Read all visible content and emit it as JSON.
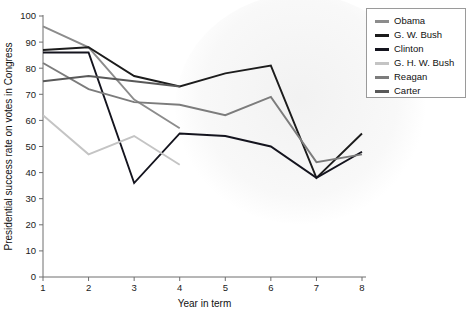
{
  "chart_data": {
    "type": "line",
    "title": "",
    "xlabel": "Year in term",
    "ylabel": "Presidential success rate on votes in Congress",
    "x": [
      1,
      2,
      3,
      4,
      5,
      6,
      7,
      8
    ],
    "xlim": [
      1,
      8
    ],
    "ylim": [
      0,
      100
    ],
    "xticks": [
      "1",
      "2",
      "3",
      "4",
      "5",
      "6",
      "7",
      "8"
    ],
    "yticks": [
      "0",
      "10",
      "20",
      "30",
      "40",
      "50",
      "60",
      "70",
      "80",
      "90",
      "100"
    ],
    "grid": false,
    "legend_position": "top-right",
    "series": [
      {
        "name": "Obama",
        "color": "#8c8c8c",
        "x": [
          1,
          2,
          3,
          4
        ],
        "values": [
          96,
          88,
          68,
          57
        ]
      },
      {
        "name": "G. W. Bush",
        "color": "#1c1c1c",
        "x": [
          1,
          2,
          3,
          4,
          5,
          6,
          7,
          8
        ],
        "values": [
          87,
          88,
          77,
          73,
          78,
          81,
          38,
          55
        ]
      },
      {
        "name": "Clinton",
        "color": "#14141e",
        "x": [
          1,
          2,
          3,
          4,
          5,
          6,
          7,
          8
        ],
        "values": [
          86,
          86,
          36,
          55,
          54,
          50,
          38,
          48
        ]
      },
      {
        "name": "G. H. W. Bush",
        "color": "#c4c4c4",
        "x": [
          1,
          2,
          3,
          4
        ],
        "values": [
          62,
          47,
          54,
          43
        ]
      },
      {
        "name": "Reagan",
        "color": "#7c7c7c",
        "x": [
          1,
          2,
          3,
          4,
          5,
          6,
          7,
          8
        ],
        "values": [
          82,
          72,
          67,
          66,
          62,
          69,
          44,
          47
        ]
      },
      {
        "name": "Carter",
        "color": "#595959",
        "x": [
          1,
          2,
          3,
          4
        ],
        "values": [
          75,
          77,
          75,
          73
        ]
      }
    ]
  },
  "legend": {
    "items": [
      {
        "label": "Obama",
        "color": "#8c8c8c"
      },
      {
        "label": "G. W. Bush",
        "color": "#1c1c1c"
      },
      {
        "label": "Clinton",
        "color": "#14141e"
      },
      {
        "label": "G. H. W. Bush",
        "color": "#c4c4c4"
      },
      {
        "label": "Reagan",
        "color": "#7c7c7c"
      },
      {
        "label": "Carter",
        "color": "#595959"
      }
    ]
  }
}
